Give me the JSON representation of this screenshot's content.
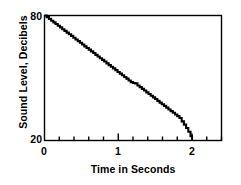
{
  "chart_data": {
    "type": "line",
    "title": "",
    "xlabel": "Time in Seconds",
    "ylabel": "Sound Level, Decibels",
    "xlim": [
      0,
      2.4
    ],
    "ylim": [
      20,
      80
    ],
    "grid": false,
    "legend": null,
    "x_ticks_labeled": [
      "0",
      "1",
      "2"
    ],
    "x_tick_values": [
      0,
      1,
      2
    ],
    "x_minor_tick_values": [
      0.2,
      0.4,
      0.6,
      0.8,
      1.2,
      1.4,
      1.6,
      1.8,
      2.2,
      2.4
    ],
    "x_minor_tick_step": 0.2,
    "y_ticks_labeled": [
      "80",
      "20"
    ],
    "y_tick_values": [
      80,
      20
    ],
    "series": [
      {
        "name": "Sound Level Decay",
        "style": "staircase",
        "color": "#000000",
        "x": [
          0.0,
          0.03,
          0.06,
          0.09,
          0.12,
          0.15,
          0.18,
          0.21,
          0.24,
          0.27,
          0.3,
          0.33,
          0.36,
          0.39,
          0.42,
          0.45,
          0.48,
          0.51,
          0.54,
          0.57,
          0.6,
          0.63,
          0.66,
          0.69,
          0.72,
          0.75,
          0.78,
          0.81,
          0.84,
          0.87,
          0.9,
          0.93,
          0.96,
          0.99,
          1.02,
          1.05,
          1.08,
          1.11,
          1.14,
          1.17,
          1.2,
          1.23,
          1.26,
          1.29,
          1.32,
          1.35,
          1.38,
          1.41,
          1.44,
          1.47,
          1.5,
          1.53,
          1.56,
          1.59,
          1.62,
          1.65,
          1.68,
          1.71,
          1.74,
          1.77,
          1.8,
          1.83,
          1.86,
          1.89,
          1.92,
          1.95,
          1.98,
          2.0
        ],
        "y": [
          80.0,
          79.2,
          78.4,
          77.5,
          76.7,
          75.9,
          75.1,
          74.3,
          73.4,
          72.6,
          71.8,
          71.0,
          70.2,
          69.3,
          68.5,
          67.7,
          66.9,
          66.1,
          65.2,
          64.4,
          63.6,
          62.8,
          62.0,
          61.1,
          60.3,
          59.5,
          58.7,
          57.9,
          57.0,
          56.2,
          55.4,
          54.6,
          53.8,
          52.9,
          52.1,
          51.3,
          50.5,
          49.7,
          48.8,
          48.0,
          47.6,
          47.4,
          46.4,
          45.6,
          44.8,
          44.0,
          43.1,
          42.3,
          41.5,
          40.7,
          39.9,
          39.0,
          38.2,
          37.4,
          36.6,
          35.8,
          34.9,
          34.1,
          33.3,
          32.5,
          31.7,
          30.8,
          29.2,
          27.6,
          26.0,
          24.2,
          22.1,
          20.0
        ]
      }
    ],
    "annotations": []
  },
  "axis": {
    "ylabel_text": "Sound Level, Decibels",
    "xlabel_text": "Time in Seconds",
    "ytick_top": "80",
    "ytick_bottom": "20",
    "xtick_0": "0",
    "xtick_1": "1",
    "xtick_2": "2"
  },
  "colors": {
    "background": "#ffffff",
    "ink": "#000000",
    "series": "#000000"
  }
}
